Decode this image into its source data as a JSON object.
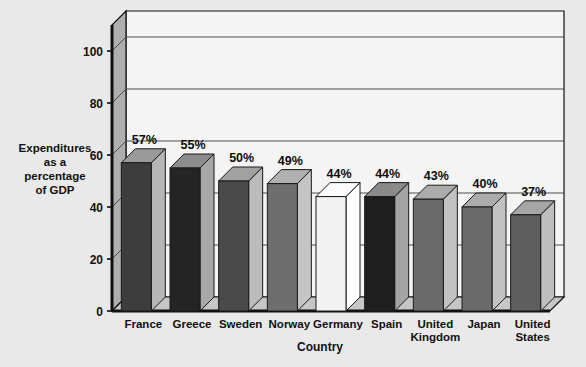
{
  "chart_data": {
    "type": "bar",
    "title": "",
    "subtitle": "",
    "xlabel": "Country",
    "ylabel": "Expenditures as a percentage of GDP",
    "ylabel_lines": [
      "Expenditures",
      "as a",
      "percentage",
      "of GDP"
    ],
    "categories": [
      "France",
      "Greece",
      "Sweden",
      "Norway",
      "Germany",
      "Spain",
      "United Kingdom",
      "Japan",
      "United States"
    ],
    "category_lines": [
      [
        "France"
      ],
      [
        "Greece"
      ],
      [
        "Sweden"
      ],
      [
        "Norway"
      ],
      [
        "Germany"
      ],
      [
        "Spain"
      ],
      [
        "United",
        "Kingdom"
      ],
      [
        "Japan"
      ],
      [
        "United",
        "States"
      ]
    ],
    "values": [
      57,
      55,
      50,
      49,
      44,
      44,
      43,
      40,
      37
    ],
    "data_labels": [
      "57%",
      "55%",
      "50%",
      "49%",
      "44%",
      "44%",
      "43%",
      "40%",
      "37%"
    ],
    "ylim": [
      0,
      110
    ],
    "yticks": [
      0,
      20,
      40,
      60,
      80,
      100
    ],
    "ytick_labels": [
      "0",
      "20",
      "40",
      "60",
      "80",
      "100"
    ],
    "grid": true,
    "legend": "none",
    "style": "3d-bar",
    "bar_face_colors": [
      "#3d3d3d",
      "#242424",
      "#4a4a4a",
      "#6e6e6e",
      "#f2f2f2",
      "#1e1e1e",
      "#6a6a6a",
      "#6a6a6a",
      "#5e5e5e"
    ],
    "bar_top_colors": [
      "#9a9a9a",
      "#8c8c8c",
      "#a2a2a2",
      "#b0b0b0",
      "#fbfbfb",
      "#8a8a8a",
      "#ababab",
      "#ababab",
      "#a6a6a6"
    ],
    "bar_side_colors": [
      "#b6b6b6",
      "#a8a8a8",
      "#bcbcbc",
      "#c4c4c4",
      "#ffffff",
      "#a4a4a4",
      "#c2c2c2",
      "#c2c2c2",
      "#bebebe"
    ],
    "plot_back_color": "#f4f4f4",
    "plot_left_wall_color": "#aeaeae",
    "plot_floor_color": "#c6c6c6",
    "page_background": "#e9e9e9",
    "axis_color": "#101010",
    "grid_color": "#4c4c4c"
  }
}
